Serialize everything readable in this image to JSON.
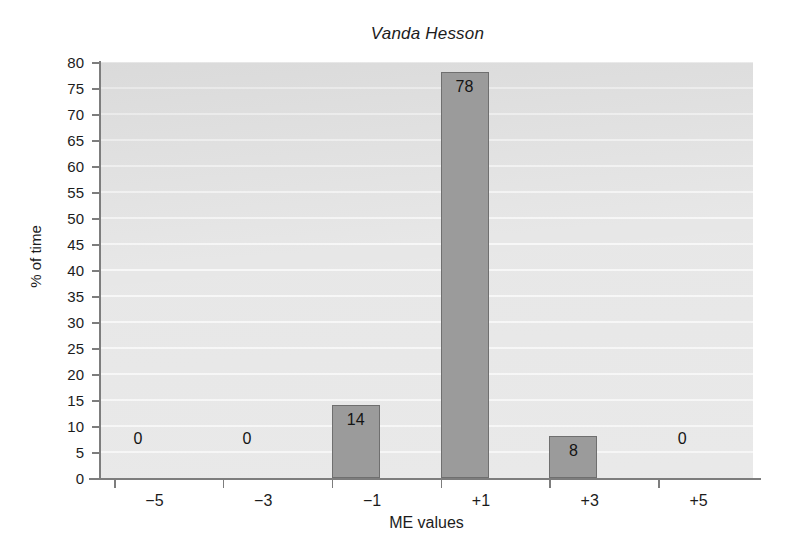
{
  "chart_data": {
    "type": "bar",
    "title": "Vanda Hesson",
    "xlabel": "ME values",
    "ylabel": "% of time",
    "categories": [
      "−5",
      "−3",
      "−1",
      "+1",
      "+3",
      "+5"
    ],
    "values": [
      0,
      0,
      14,
      78,
      8,
      0
    ],
    "data_labels": [
      "0",
      "0",
      "14",
      "78",
      "8",
      "0"
    ],
    "ylim": [
      0,
      80
    ],
    "ytick_step": 5,
    "ytick_labels": [
      "80",
      "75",
      "70",
      "65",
      "60",
      "55",
      "50",
      "45",
      "40",
      "35",
      "30",
      "25",
      "20",
      "15",
      "10",
      "5",
      "0"
    ],
    "ytick_values": [
      80,
      75,
      70,
      65,
      60,
      55,
      50,
      45,
      40,
      35,
      30,
      25,
      20,
      15,
      10,
      5,
      0
    ],
    "grid": true,
    "grid_orientation": "horizontal",
    "legend": false,
    "legend_position": "none",
    "colors": {
      "bar_fill": "#9b9b9b",
      "bar_edge": "#6f6f6f",
      "plot_background": "#e4e4e4",
      "gridline": "#f7f7f7",
      "axis": "#7d7d7d",
      "text": "#1c1c1c",
      "figure_background": "#ffffff"
    }
  }
}
